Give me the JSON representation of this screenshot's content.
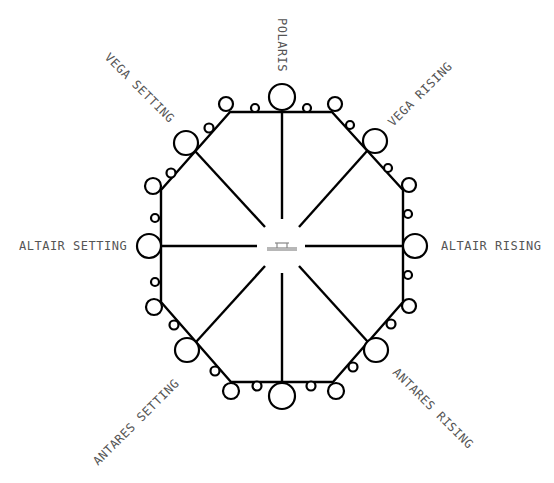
{
  "diagram": {
    "labels": {
      "north": "POLARIS",
      "northeast": "VEGA RISING",
      "east": "ALTAIR RISING",
      "southeast": "ANTARES RISING",
      "south": "",
      "southwest": "ANTARES SETTING",
      "west": "ALTAIR SETTING",
      "northwest": "VEGA SETTING"
    },
    "center_symbol": "table-icon",
    "colors": {
      "line": "#000000",
      "label": "#555555",
      "center": "#888888",
      "background": "#ffffff"
    },
    "sides": 8,
    "spokes": 8,
    "seats_per_side": {
      "large": 1,
      "small": 2,
      "corner": 1
    }
  }
}
